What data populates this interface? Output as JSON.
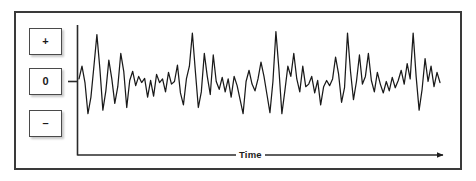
{
  "figure": {
    "title": "",
    "frame_color": "#3a3a3a",
    "background_color": "#ffffff",
    "trace_color": "#1a1a1a"
  },
  "amplitude_legend": {
    "boxes": [
      {
        "name": "positive",
        "label": "+"
      },
      {
        "name": "zero",
        "label": "0"
      },
      {
        "name": "negative",
        "label": "–"
      }
    ]
  },
  "axes": {
    "x_label": "Time",
    "x_arrow": "right-arrow",
    "y_tick_label": "0",
    "y_axis_visible": true,
    "x_axis_visible": true
  },
  "chart_data": {
    "type": "line",
    "title": "",
    "xlabel": "Time",
    "ylabel": "",
    "grid": false,
    "legend": null,
    "xlim": [
      0,
      280
    ],
    "ylim": [
      -1.0,
      1.0
    ],
    "ytick_labels": [
      "+",
      "0",
      "–"
    ],
    "ytick_values": [
      0.72,
      0.0,
      -0.62
    ],
    "series": [
      {
        "name": "signal",
        "color": "#1a1a1a",
        "values": [
          0.05,
          0.3,
          -0.02,
          -0.62,
          -0.3,
          0.3,
          0.92,
          0.25,
          -0.55,
          -0.18,
          0.42,
          0.05,
          -0.42,
          -0.1,
          0.55,
          0.2,
          -0.5,
          0.02,
          0.2,
          -0.08,
          0.1,
          -0.02,
          0.06,
          -0.3,
          0.02,
          -0.28,
          0.14,
          -0.02,
          0.05,
          -0.2,
          0.18,
          -0.05,
          0.0,
          0.32,
          -0.22,
          -0.45,
          0.05,
          0.3,
          0.95,
          0.2,
          -0.5,
          -0.2,
          0.55,
          0.1,
          -0.25,
          0.52,
          0.0,
          -0.15,
          0.08,
          -0.2,
          0.05,
          -0.3,
          0.1,
          -0.08,
          -0.35,
          -0.62,
          0.0,
          0.22,
          -0.05,
          -0.18,
          0.05,
          0.38,
          0.1,
          -0.25,
          -0.6,
          0.0,
          0.98,
          0.25,
          -0.62,
          -0.18,
          0.3,
          0.1,
          0.55,
          0.05,
          -0.2,
          0.3,
          -0.1,
          -0.05,
          0.1,
          -0.22,
          0.02,
          -0.45,
          -0.1,
          0.02,
          -0.08,
          0.05,
          0.48,
          0.15,
          -0.4,
          -0.12,
          0.95,
          0.2,
          -0.35,
          0.0,
          0.52,
          -0.05,
          0.1,
          0.55,
          0.02,
          -0.2,
          0.18,
          -0.05,
          -0.22,
          0.0,
          -0.18,
          0.08,
          -0.12,
          0.02,
          0.22,
          -0.05,
          0.35,
          0.05,
          0.95,
          0.1,
          -0.55,
          -0.15,
          0.45,
          0.0,
          0.3,
          -0.1,
          0.18,
          -0.02
        ]
      }
    ]
  }
}
